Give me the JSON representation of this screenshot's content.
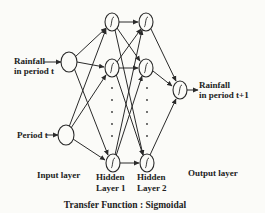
{
  "diagram": {
    "type": "feedforward-neural-network",
    "inputs": {
      "rainfall_line1": "Rainfall",
      "rainfall_line2": "in period t",
      "period": "Period t"
    },
    "output": {
      "line1": "Rainfall",
      "line2": "in period t+1"
    },
    "layers": {
      "input": "Input layer",
      "hidden1_line1": "Hidden",
      "hidden1_line2": "Layer 1",
      "hidden2_line1": "Hidden",
      "hidden2_line2": "Layer 2",
      "output": "Output layer"
    },
    "caption": "Transfer Function : Sigmoidal",
    "node_icon": "sigmoid-icon",
    "colors": {
      "background": "#fbfbf8",
      "ink": "#2a2a2a"
    }
  }
}
